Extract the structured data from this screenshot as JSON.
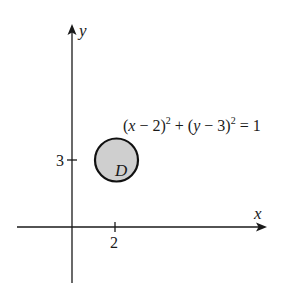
{
  "diagram": {
    "axes": {
      "x_label": "x",
      "y_label": "y"
    },
    "ticks": {
      "x": [
        {
          "value": 2,
          "label": "2"
        }
      ],
      "y": [
        {
          "value": 3,
          "label": "3"
        }
      ]
    },
    "region": {
      "label": "D",
      "center": [
        2,
        3
      ],
      "radius": 1,
      "fill_color": "#cfcfcf",
      "stroke_color": "#111111"
    },
    "equation": {
      "part1": "(",
      "x_var": "x",
      "part2": " − 2)",
      "exp1": "2",
      "part3": " + (",
      "y_var": "y",
      "part4": " − 3)",
      "exp2": "2",
      "part5": " = 1"
    },
    "colors": {
      "line": "#1a1a1a",
      "background": "#ffffff"
    }
  }
}
